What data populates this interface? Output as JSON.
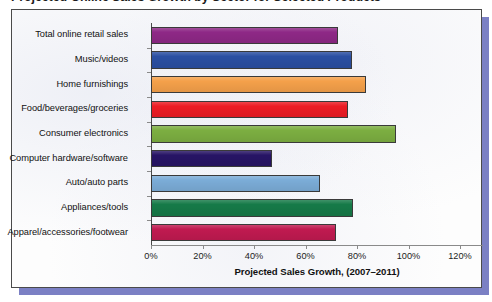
{
  "page": {
    "title": "Projected Online Sales Growth by Sector for Selected Products"
  },
  "chart_data": {
    "type": "bar",
    "orientation": "horizontal",
    "title": "Projected Online Sales Growth by Sector for Selected Products",
    "xlabel": "Projected Sales Growth, (2007–2011)",
    "ylabel": "",
    "xlim": [
      0,
      120
    ],
    "xticks": [
      "0%",
      "20%",
      "40%",
      "60%",
      "80%",
      "100%",
      "120%"
    ],
    "xtick_values": [
      0,
      20,
      40,
      60,
      80,
      100,
      120
    ],
    "grid": false,
    "legend": "none",
    "categories": [
      "Total online retail sales",
      "Music/videos",
      "Home furnishings",
      "Food/beverages/groceries",
      "Consumer electronics",
      "Computer hardware/software",
      "Auto/auto parts",
      "Appliances/tools",
      "Apparel/accessories/footwear"
    ],
    "values": [
      72.5,
      78.0,
      83.5,
      76.5,
      95.0,
      47.0,
      65.5,
      78.5,
      72.0
    ],
    "colors": [
      "#8E2886",
      "#2B4FA2",
      "#F4A04A",
      "#EC1C24",
      "#7CAE41",
      "#271465",
      "#7BACD7",
      "#167A48",
      "#C01A50"
    ],
    "bars": [
      {
        "label": "Total online retail sales",
        "value": 72.5,
        "color": "#8E2886"
      },
      {
        "label": "Music/videos",
        "value": 78.0,
        "color": "#2B4FA2"
      },
      {
        "label": "Home furnishings",
        "value": 83.5,
        "color": "#F4A04A"
      },
      {
        "label": "Food/beverages/groceries",
        "value": 76.5,
        "color": "#EC1C24"
      },
      {
        "label": "Consumer electronics",
        "value": 95.0,
        "color": "#7CAE41"
      },
      {
        "label": "Computer hardware/software",
        "value": 47.0,
        "color": "#271465"
      },
      {
        "label": "Auto/auto parts",
        "value": 65.5,
        "color": "#7BACD7"
      },
      {
        "label": "Appliances/tools",
        "value": 78.5,
        "color": "#167A48"
      },
      {
        "label": "Apparel/accessories/footwear",
        "value": 72.0,
        "color": "#C01A50"
      }
    ]
  },
  "style": {
    "frame_border": "#4a4a4a",
    "shadow": "#7b80c4",
    "plot_background": "#fdfdfd",
    "axis": "#8a8a8a"
  }
}
